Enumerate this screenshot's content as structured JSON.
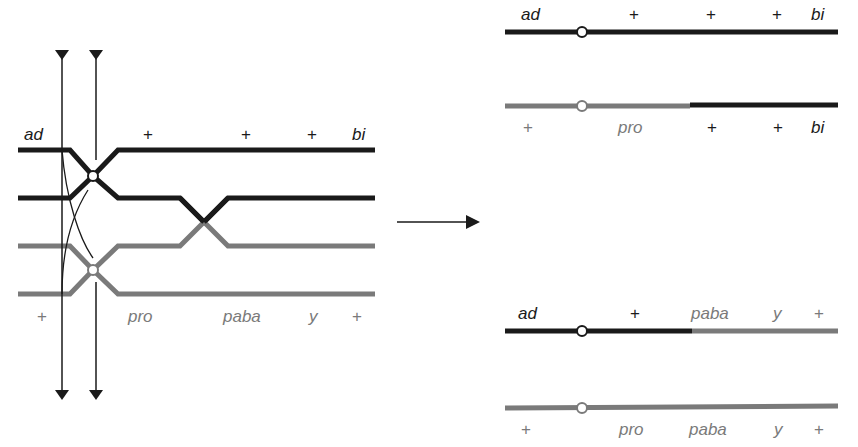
{
  "colors": {
    "dark_chromosome": "#1a1a1a",
    "gray_chromosome": "#7a7a7a",
    "background": "#ffffff"
  },
  "left_panel": {
    "top_labels": {
      "ad": "ad",
      "plus1": "+",
      "plus2": "+",
      "plus3": "+",
      "bi": "bi"
    },
    "bottom_labels": {
      "plus1": "+",
      "pro": "pro",
      "paba": "paba",
      "y": "y",
      "plus2": "+"
    }
  },
  "arrow": {
    "direction": "right"
  },
  "right_panel": {
    "product_1": {
      "top": {
        "ad": "ad",
        "plus1": "+",
        "plus2": "+",
        "plus3": "+",
        "bi": "bi"
      },
      "bottom": {
        "plus1": "+",
        "pro": "pro",
        "plus2": "+",
        "plus3": "+",
        "bi": "bi"
      }
    },
    "product_2": {
      "top": {
        "ad": "ad",
        "plus1": "+",
        "paba": "paba",
        "y": "y",
        "plus2": "+"
      },
      "bottom": {
        "plus1": "+",
        "pro": "pro",
        "paba": "paba",
        "y": "y",
        "plus2": "+"
      }
    }
  }
}
